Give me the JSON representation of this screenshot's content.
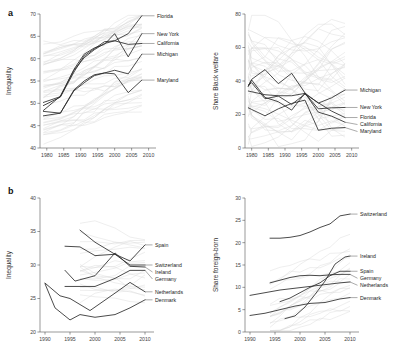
{
  "figure": {
    "panels": [
      {
        "letter": "a"
      },
      {
        "letter": "b"
      }
    ]
  },
  "chart_data": [
    {
      "id": "a-left",
      "type": "line",
      "title": "",
      "xlabel": "",
      "ylabel": "Inequality",
      "xlim": [
        1978,
        2011
      ],
      "ylim": [
        40,
        70
      ],
      "xticks": [
        1980,
        1985,
        1990,
        1995,
        2000,
        2005,
        2010
      ],
      "yticks": [
        40,
        45,
        50,
        55,
        60,
        65,
        70
      ],
      "grid": false,
      "legend_position": "right-inline-labels",
      "series": [
        {
          "name": "Florida",
          "x": [
            1979,
            1984,
            1988,
            1991,
            1994,
            1997,
            2000,
            2004,
            2008
          ],
          "values": [
            48.4,
            51.6,
            57.4,
            60.2,
            62.0,
            63.4,
            64.0,
            65.6,
            69.6
          ]
        },
        {
          "name": "New York",
          "x": [
            1979,
            1984,
            1988,
            1991,
            1994,
            1997,
            2000,
            2004,
            2008
          ],
          "values": [
            50.2,
            51.5,
            57.6,
            61.0,
            62.4,
            63.2,
            65.6,
            60.4,
            65.6
          ]
        },
        {
          "name": "California",
          "x": [
            1979,
            1984,
            1988,
            1991,
            1994,
            1997,
            2000,
            2004,
            2008
          ],
          "values": [
            49.5,
            51.4,
            57.0,
            60.6,
            62.2,
            63.8,
            64.0,
            63.2,
            63.4
          ]
        },
        {
          "name": "Michigan",
          "x": [
            1979,
            1984,
            1988,
            1991,
            1994,
            1997,
            2000,
            2004,
            2008
          ],
          "values": [
            48.2,
            47.8,
            52.8,
            54.6,
            56.2,
            56.8,
            57.4,
            56.6,
            61.0
          ]
        },
        {
          "name": "Maryland",
          "x": [
            1979,
            1984,
            1988,
            1991,
            1994,
            1997,
            2000,
            2004,
            2008
          ],
          "values": [
            47.2,
            47.8,
            53.0,
            55.0,
            56.4,
            56.8,
            56.6,
            52.4,
            55.2
          ]
        }
      ],
      "background_series_note": "grey lines = all other US states"
    },
    {
      "id": "a-right",
      "type": "line",
      "title": "",
      "xlabel": "",
      "ylabel": "Share Black welfare",
      "xlim": [
        1978,
        2011
      ],
      "ylim": [
        0,
        80
      ],
      "xticks": [
        1980,
        1985,
        1990,
        1995,
        2000,
        2005,
        2010
      ],
      "yticks": [
        0,
        20,
        40,
        60,
        80
      ],
      "grid": false,
      "legend_position": "right-inline-labels",
      "series": [
        {
          "name": "Michigan",
          "x": [
            1979,
            1980,
            1984,
            1988,
            1992,
            1996,
            2000,
            2004,
            2008
          ],
          "values": [
            37.0,
            41.0,
            46.8,
            38.4,
            44.6,
            32.8,
            26.8,
            30.0,
            34.6
          ]
        },
        {
          "name": "New York",
          "x": [
            1979,
            1980,
            1984,
            1988,
            1992,
            1996,
            2000,
            2004,
            2008
          ],
          "values": [
            34.0,
            33.6,
            31.8,
            31.2,
            31.2,
            32.6,
            23.4,
            24.0,
            24.2
          ]
        },
        {
          "name": "Florida",
          "x": [
            1979,
            1980,
            1984,
            1988,
            1992,
            1996,
            2000,
            2004,
            2008
          ],
          "values": [
            37.6,
            39.0,
            29.4,
            31.0,
            26.0,
            32.2,
            27.0,
            22.0,
            18.2
          ]
        },
        {
          "name": "California",
          "x": [
            1979,
            1980,
            1984,
            1988,
            1992,
            1996,
            2000,
            2004,
            2008
          ],
          "values": [
            36.8,
            40.6,
            30.2,
            27.6,
            22.6,
            32.8,
            21.4,
            19.0,
            15.4
          ]
        },
        {
          "name": "Maryland",
          "x": [
            1979,
            1980,
            1984,
            1988,
            1992,
            1996,
            2000,
            2004,
            2008
          ],
          "values": [
            24.0,
            23.0,
            19.2,
            23.4,
            26.6,
            28.6,
            10.6,
            11.8,
            12.2
          ]
        }
      ],
      "background_series_note": "grey lines = all other US states"
    },
    {
      "id": "b-left",
      "type": "line",
      "title": "",
      "xlabel": "",
      "ylabel": "Inequality",
      "xlim": [
        1989,
        2011
      ],
      "ylim": [
        20,
        40
      ],
      "xticks": [
        1990,
        1995,
        2000,
        2005,
        2010
      ],
      "yticks": [
        20,
        25,
        30,
        35,
        40
      ],
      "grid": false,
      "legend_position": "right-inline-labels",
      "series": [
        {
          "name": "Spain",
          "x": [
            1997,
            2000,
            2004,
            2007,
            2010
          ],
          "values": [
            35.2,
            33.4,
            31.6,
            30.6,
            33.0
          ]
        },
        {
          "name": "Switzerland",
          "x": [
            1994,
            1997,
            2000,
            2004,
            2007,
            2010
          ],
          "values": [
            32.8,
            32.7,
            31.4,
            31.6,
            30.0,
            30.0
          ]
        },
        {
          "name": "Ireland",
          "x": [
            1994,
            1996,
            2000,
            2004,
            2007,
            2010
          ],
          "values": [
            29.2,
            27.6,
            28.4,
            31.8,
            29.8,
            29.7
          ]
        },
        {
          "name": "Germany",
          "x": [
            1994,
            2000,
            2004,
            2007,
            2010
          ],
          "values": [
            26.8,
            26.8,
            28.0,
            29.2,
            29.2
          ]
        },
        {
          "name": "Netherlands",
          "x": [
            1990,
            1993,
            1995,
            1999,
            2004,
            2007,
            2010
          ],
          "values": [
            27.3,
            25.4,
            25.0,
            23.2,
            25.8,
            27.4,
            26.0
          ]
        },
        {
          "name": "Denmark",
          "x": [
            1990,
            1992,
            1995,
            1997,
            2000,
            2004,
            2007,
            2010
          ],
          "values": [
            27.2,
            23.6,
            21.8,
            22.6,
            22.2,
            22.6,
            23.6,
            24.8
          ]
        }
      ],
      "background_series_note": "grey lines = other countries"
    },
    {
      "id": "b-right",
      "type": "line",
      "title": "",
      "xlabel": "",
      "ylabel": "Share foreign-born",
      "xlim": [
        1989,
        2011
      ],
      "ylim": [
        0,
        30
      ],
      "xticks": [
        1990,
        1995,
        2000,
        2005,
        2010
      ],
      "yticks": [
        0,
        5,
        10,
        15,
        20,
        25,
        30
      ],
      "grid": false,
      "legend_position": "right-inline-labels",
      "series": [
        {
          "name": "Switzerland",
          "x": [
            1994,
            1996,
            1998,
            2000,
            2002,
            2004,
            2006,
            2008,
            2010
          ],
          "values": [
            21.0,
            21.0,
            21.2,
            21.6,
            22.4,
            23.4,
            24.2,
            26.0,
            26.4
          ]
        },
        {
          "name": "Ireland",
          "x": [
            1997,
            1999,
            2001,
            2003,
            2005,
            2007,
            2009,
            2010
          ],
          "values": [
            3.0,
            3.6,
            5.6,
            8.4,
            11.4,
            15.2,
            16.8,
            17.0
          ]
        },
        {
          "name": "Spain",
          "x": [
            1996,
            1998,
            2000,
            2002,
            2004,
            2006,
            2008,
            2010
          ],
          "values": [
            6.8,
            7.6,
            8.8,
            10.0,
            11.0,
            12.6,
            13.6,
            13.6
          ]
        },
        {
          "name": "Germany",
          "x": [
            1994,
            1996,
            1998,
            2000,
            2002,
            2004,
            2006,
            2008,
            2010
          ],
          "values": [
            11.0,
            11.6,
            12.2,
            12.6,
            12.7,
            12.6,
            12.8,
            12.9,
            12.9
          ]
        },
        {
          "name": "Netherlands",
          "x": [
            1990,
            1993,
            1996,
            1999,
            2002,
            2005,
            2008,
            2010
          ],
          "values": [
            8.2,
            8.8,
            9.4,
            9.8,
            10.2,
            10.6,
            11.0,
            11.2
          ]
        },
        {
          "name": "Denmark",
          "x": [
            1990,
            1993,
            1996,
            1999,
            2002,
            2005,
            2008,
            2010
          ],
          "values": [
            3.7,
            4.2,
            5.0,
            5.8,
            6.4,
            6.6,
            7.4,
            7.7
          ]
        }
      ],
      "background_series_note": "grey lines = other countries"
    }
  ]
}
